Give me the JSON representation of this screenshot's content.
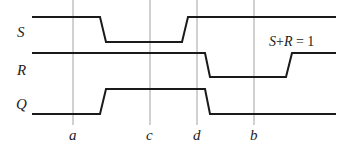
{
  "diagram": {
    "type": "timing-diagram",
    "signals": [
      {
        "name": "S",
        "label": "S",
        "high_y": 17,
        "low_y": 42,
        "label_y": 37,
        "waveform": "high -> falls near a-c -> low through c -> rises before d -> high"
      },
      {
        "name": "R",
        "label": "R",
        "high_y": 53,
        "low_y": 77,
        "label_y": 75,
        "waveform": "high -> falls just after d -> low through b -> rises after b -> high"
      },
      {
        "name": "Q",
        "label": "Q",
        "high_y": 89,
        "low_y": 114,
        "label_y": 109,
        "waveform": "low -> rises between a and c -> high through c and d -> falls just after d -> low"
      }
    ],
    "markers": [
      {
        "label": "a",
        "x": 73
      },
      {
        "label": "c",
        "x": 150
      },
      {
        "label": "d",
        "x": 197
      },
      {
        "label": "b",
        "x": 254
      }
    ],
    "annotation": {
      "text": "S+R = 1",
      "parts": [
        "S",
        "+",
        "R",
        " = 1"
      ]
    },
    "colors": {
      "signal": "#1a1a1a",
      "marker": "#777777",
      "text": "#222222"
    }
  }
}
